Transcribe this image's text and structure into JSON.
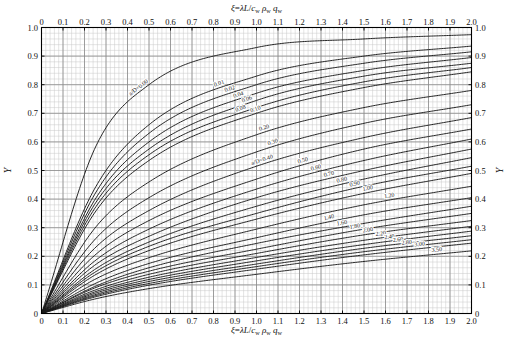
{
  "chart_data": {
    "type": "line",
    "title": "",
    "subtitle": "",
    "xlabel": "ξ=λL/cᵥᵥ ρᵥᵥ qᵥᵥ",
    "xlabel_top": "ξ=λL/cᵥᵥ ρᵥᵥ qᵥᵥ",
    "ylabel": "Y",
    "ylabel_right": "Y",
    "xlim": [
      0,
      2.0
    ],
    "ylim": [
      0,
      1.0
    ],
    "grid": true,
    "grid_minor_x": 0.02,
    "grid_minor_y": 0.02,
    "grid_major_x": 0.1,
    "grid_major_y": 0.1,
    "legend_position": "inline-curve-labels",
    "x_ticks": [
      "0",
      "0.1",
      "0.2",
      "0.3",
      "0.4",
      "0.5",
      "0.6",
      "0.7",
      "0.8",
      "0.9",
      "1.0",
      "1.1",
      "1.2",
      "1.3",
      "1.4",
      "1.5",
      "1.6",
      "1.7",
      "1.8",
      "1.9",
      "2.0"
    ],
    "x_tick_values": [
      0,
      0.1,
      0.2,
      0.3,
      0.4,
      0.5,
      0.6,
      0.7,
      0.8,
      0.9,
      1.0,
      1.1,
      1.2,
      1.3,
      1.4,
      1.5,
      1.6,
      1.7,
      1.8,
      1.9,
      2.0
    ],
    "y_ticks": [
      "0",
      "0.1",
      "0.2",
      "0.3",
      "0.4",
      "0.5",
      "0.6",
      "0.7",
      "0.8",
      "0.9",
      "1.0"
    ],
    "y_tick_values": [
      0,
      0.1,
      0.2,
      0.3,
      0.4,
      0.5,
      0.6,
      0.7,
      0.8,
      0.9,
      1.0
    ],
    "parameter_name": "a/D",
    "series": [
      {
        "name": "a/D=0.00",
        "label": "a/D=0.00",
        "param": 0.0,
        "label_x": 0.46,
        "values_at": {
          "0.25": 0.58,
          "0.5": 0.8,
          "1.0": 0.93,
          "1.5": 0.96,
          "2.0": 0.975
        }
      },
      {
        "name": "0.01",
        "label": "0.01",
        "param": 0.01,
        "label_x": 0.83,
        "values_at": {
          "0.25": 0.44,
          "0.5": 0.66,
          "1.0": 0.83,
          "1.5": 0.9,
          "2.0": 0.935
        }
      },
      {
        "name": "0.02",
        "label": "0.02",
        "param": 0.02,
        "label_x": 0.88,
        "values_at": {
          "0.25": 0.42,
          "0.5": 0.63,
          "1.0": 0.8,
          "1.5": 0.875,
          "2.0": 0.915
        }
      },
      {
        "name": "0.04",
        "label": "0.04",
        "param": 0.04,
        "label_x": 0.92,
        "values_at": {
          "0.25": 0.4,
          "0.5": 0.6,
          "1.0": 0.77,
          "1.5": 0.85,
          "2.0": 0.895
        }
      },
      {
        "name": "0.06",
        "label": "0.06",
        "param": 0.06,
        "label_x": 0.96,
        "values_at": {
          "0.25": 0.385,
          "0.5": 0.575,
          "1.0": 0.745,
          "1.5": 0.83,
          "2.0": 0.875
        }
      },
      {
        "name": "0.08",
        "label": "0.08",
        "param": 0.08,
        "label_x": 0.93,
        "values_at": {
          "0.25": 0.37,
          "0.5": 0.555,
          "1.0": 0.72,
          "1.5": 0.81,
          "2.0": 0.86
        }
      },
      {
        "name": "0.10",
        "label": "0.10",
        "param": 0.1,
        "label_x": 1.0,
        "values_at": {
          "0.25": 0.355,
          "0.5": 0.535,
          "1.0": 0.7,
          "1.5": 0.79,
          "2.0": 0.845
        }
      },
      {
        "name": "0.20",
        "label": "0.20",
        "param": 0.2,
        "label_x": 1.04,
        "values_at": {
          "0.25": 0.3,
          "0.5": 0.46,
          "1.0": 0.625,
          "1.5": 0.72,
          "2.0": 0.78
        }
      },
      {
        "name": "0.30",
        "label": "0.30",
        "param": 0.3,
        "label_x": 1.08,
        "values_at": {
          "0.25": 0.26,
          "0.5": 0.405,
          "1.0": 0.565,
          "1.5": 0.665,
          "2.0": 0.73
        }
      },
      {
        "name": "a/D=0.40",
        "label": "a/D=0.40",
        "param": 0.4,
        "label_x": 1.03,
        "values_at": {
          "0.25": 0.23,
          "0.5": 0.36,
          "1.0": 0.515,
          "1.5": 0.615,
          "2.0": 0.685
        }
      },
      {
        "name": "0.50",
        "label": "0.50",
        "param": 0.5,
        "label_x": 1.22,
        "values_at": {
          "0.25": 0.205,
          "0.5": 0.325,
          "1.0": 0.47,
          "1.5": 0.575,
          "2.0": 0.645
        }
      },
      {
        "name": "0.60",
        "label": "0.60",
        "param": 0.6,
        "label_x": 1.28,
        "values_at": {
          "0.25": 0.185,
          "0.5": 0.295,
          "1.0": 0.435,
          "1.5": 0.535,
          "2.0": 0.61
        }
      },
      {
        "name": "0.70",
        "label": "0.70",
        "param": 0.7,
        "label_x": 1.34,
        "values_at": {
          "0.25": 0.17,
          "0.5": 0.27,
          "1.0": 0.405,
          "1.5": 0.5,
          "2.0": 0.575
        }
      },
      {
        "name": "0.80",
        "label": "0.80",
        "param": 0.8,
        "label_x": 1.4,
        "values_at": {
          "0.25": 0.155,
          "0.5": 0.25,
          "1.0": 0.375,
          "1.5": 0.47,
          "2.0": 0.545
        }
      },
      {
        "name": "0.90",
        "label": "0.90",
        "param": 0.9,
        "label_x": 1.46,
        "values_at": {
          "0.25": 0.145,
          "0.5": 0.235,
          "1.0": 0.35,
          "1.5": 0.445,
          "2.0": 0.515
        }
      },
      {
        "name": "1.00",
        "label": "1.00",
        "param": 1.0,
        "label_x": 1.52,
        "values_at": {
          "0.25": 0.135,
          "0.5": 0.22,
          "1.0": 0.33,
          "1.5": 0.42,
          "2.0": 0.49
        }
      },
      {
        "name": "1.20",
        "label": "1.20",
        "param": 1.2,
        "label_x": 1.62,
        "values_at": {
          "0.25": 0.12,
          "0.5": 0.195,
          "1.0": 0.295,
          "1.5": 0.38,
          "2.0": 0.445
        }
      },
      {
        "name": "1.40",
        "label": "1.40",
        "param": 1.4,
        "label_x": 1.34,
        "values_at": {
          "0.25": 0.105,
          "0.5": 0.175,
          "1.0": 0.265,
          "1.5": 0.345,
          "2.0": 0.405
        }
      },
      {
        "name": "1.60",
        "label": "1.60",
        "param": 1.6,
        "label_x": 1.4,
        "values_at": {
          "0.25": 0.095,
          "0.5": 0.16,
          "1.0": 0.245,
          "1.5": 0.315,
          "2.0": 0.375
        }
      },
      {
        "name": "1.80",
        "label": "1.80",
        "param": 1.8,
        "label_x": 1.46,
        "values_at": {
          "0.25": 0.09,
          "0.5": 0.148,
          "1.0": 0.225,
          "1.5": 0.295,
          "2.0": 0.35
        }
      },
      {
        "name": "2.00",
        "label": "2.00",
        "param": 2.0,
        "label_x": 1.52,
        "values_at": {
          "0.25": 0.082,
          "0.5": 0.137,
          "1.0": 0.21,
          "1.5": 0.275,
          "2.0": 0.325
        }
      },
      {
        "name": "2.20",
        "label": "2.20",
        "param": 2.2,
        "label_x": 1.58,
        "values_at": {
          "0.25": 0.076,
          "0.5": 0.127,
          "1.0": 0.196,
          "1.5": 0.256,
          "2.0": 0.305
        }
      },
      {
        "name": "2.40",
        "label": "2.40",
        "param": 2.4,
        "label_x": 1.62,
        "values_at": {
          "0.25": 0.071,
          "0.5": 0.119,
          "1.0": 0.184,
          "1.5": 0.241,
          "2.0": 0.288
        }
      },
      {
        "name": "2.60",
        "label": "2.60",
        "param": 2.6,
        "label_x": 1.66,
        "values_at": {
          "0.25": 0.066,
          "0.5": 0.112,
          "1.0": 0.173,
          "1.5": 0.228,
          "2.0": 0.272
        }
      },
      {
        "name": "2.80",
        "label": "2.80",
        "param": 2.8,
        "label_x": 1.7,
        "values_at": {
          "0.25": 0.062,
          "0.5": 0.105,
          "1.0": 0.164,
          "1.5": 0.216,
          "2.0": 0.258
        }
      },
      {
        "name": "3.00",
        "label": "3.00",
        "param": 3.0,
        "label_x": 1.76,
        "values_at": {
          "0.25": 0.058,
          "0.5": 0.099,
          "1.0": 0.155,
          "1.5": 0.205,
          "2.0": 0.246
        }
      },
      {
        "name": "3.50",
        "label": "3.50",
        "param": 3.5,
        "label_x": 1.84,
        "values_at": {
          "0.25": 0.051,
          "0.5": 0.087,
          "1.0": 0.137,
          "1.5": 0.182,
          "2.0": 0.219
        }
      }
    ]
  },
  "axes": {
    "top_title": "ξ=λL/cᵥᵥ ρᵥᵥ qᵥᵥ",
    "bottom_title": "ξ=λL/cᵥᵥ ρᵥᵥ qᵥᵥ",
    "left_title": "Y",
    "right_title": "Y"
  },
  "style": {
    "curve_color": "#1a1a1a",
    "grid_major_color": "#8a8a8a",
    "grid_minor_color": "#c9c9c9",
    "frame_color": "#000000",
    "background": "#ffffff"
  }
}
